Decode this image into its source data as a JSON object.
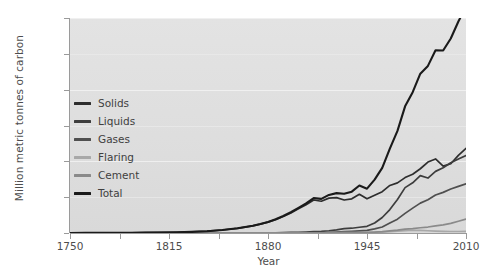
{
  "chart_data": {
    "type": "line",
    "title": "",
    "xlabel": "Year",
    "ylabel": "Million metric tonnes of carbon",
    "xlim": [
      1750,
      2010
    ],
    "ylim": [
      0,
      9000
    ],
    "xticks": [
      "1750",
      "1815",
      "1880",
      "1945",
      "2010"
    ],
    "yticks": [
      "0",
      "3000",
      "6000",
      "9000"
    ],
    "y_minor_ticks": [
      "1500",
      "4500",
      "7500"
    ],
    "grid": true,
    "legend_position": "left-inside",
    "panel_background": "#e0e0e0",
    "x": [
      1750,
      1760,
      1770,
      1780,
      1790,
      1800,
      1810,
      1820,
      1830,
      1840,
      1850,
      1860,
      1870,
      1875,
      1880,
      1885,
      1890,
      1895,
      1900,
      1905,
      1910,
      1915,
      1920,
      1925,
      1930,
      1935,
      1940,
      1945,
      1950,
      1955,
      1960,
      1965,
      1970,
      1975,
      1980,
      1985,
      1990,
      1995,
      2000,
      2005,
      2010
    ],
    "series": [
      {
        "name": "Solids",
        "color": "#2e2e2e",
        "values": [
          3,
          4,
          5,
          7,
          10,
          15,
          23,
          32,
          48,
          75,
          125,
          196,
          300,
          370,
          455,
          560,
          690,
          840,
          1010,
          1180,
          1380,
          1330,
          1460,
          1480,
          1380,
          1430,
          1620,
          1430,
          1580,
          1730,
          1990,
          2100,
          2320,
          2460,
          2690,
          2970,
          3100,
          2800,
          2900,
          3250,
          3540
        ]
      },
      {
        "name": "Liquids",
        "color": "#3d3d3d",
        "values": [
          0,
          0,
          0,
          0,
          0,
          0,
          0,
          0,
          0,
          0,
          0,
          1,
          3,
          5,
          8,
          11,
          16,
          22,
          30,
          42,
          58,
          72,
          95,
          130,
          180,
          200,
          240,
          280,
          420,
          650,
          980,
          1400,
          1900,
          2100,
          2400,
          2300,
          2580,
          2730,
          2940,
          3100,
          3240
        ]
      },
      {
        "name": "Gases",
        "color": "#4f4f4f",
        "values": [
          0,
          0,
          0,
          0,
          0,
          0,
          0,
          0,
          0,
          0,
          0,
          0,
          0,
          0,
          1,
          1,
          2,
          3,
          5,
          8,
          12,
          17,
          25,
          38,
          55,
          70,
          90,
          110,
          170,
          250,
          420,
          580,
          820,
          1040,
          1250,
          1390,
          1590,
          1700,
          1840,
          1950,
          2060
        ]
      },
      {
        "name": "Flaring",
        "color": "#a8a8a8",
        "values": [
          0,
          0,
          0,
          0,
          0,
          0,
          0,
          0,
          0,
          0,
          0,
          0,
          0,
          0,
          0,
          0,
          0,
          0,
          0,
          0,
          0,
          1,
          2,
          4,
          6,
          8,
          10,
          14,
          22,
          38,
          55,
          75,
          100,
          115,
          110,
          95,
          80,
          70,
          62,
          62,
          65
        ]
      },
      {
        "name": "Cement",
        "color": "#8a8a8a",
        "values": [
          0,
          0,
          0,
          0,
          0,
          0,
          0,
          0,
          0,
          0,
          0,
          0,
          0,
          0,
          1,
          1,
          2,
          3,
          4,
          6,
          8,
          9,
          12,
          18,
          25,
          22,
          28,
          22,
          40,
          60,
          90,
          120,
          160,
          180,
          220,
          250,
          300,
          340,
          400,
          490,
          580
        ]
      },
      {
        "name": "Total",
        "color": "#1a1a1a",
        "values": [
          3,
          4,
          5,
          7,
          10,
          15,
          23,
          32,
          48,
          75,
          125,
          197,
          303,
          375,
          465,
          573,
          710,
          868,
          1049,
          1236,
          1458,
          1429,
          1594,
          1670,
          1646,
          1730,
          1988,
          1856,
          2232,
          2728,
          3535,
          4275,
          5302,
          5895,
          6670,
          6995,
          7650,
          7640,
          8142,
          8852,
          9480
        ]
      }
    ]
  },
  "legend": {
    "items": [
      {
        "label": "Solids",
        "swatch": "#2e2e2e"
      },
      {
        "label": "Liquids",
        "swatch": "#3d3d3d"
      },
      {
        "label": "Gases",
        "swatch": "#4f4f4f"
      },
      {
        "label": "Flaring",
        "swatch": "#a8a8a8"
      },
      {
        "label": "Cement",
        "swatch": "#8a8a8a"
      },
      {
        "label": "Total",
        "swatch": "#1a1a1a"
      }
    ]
  }
}
